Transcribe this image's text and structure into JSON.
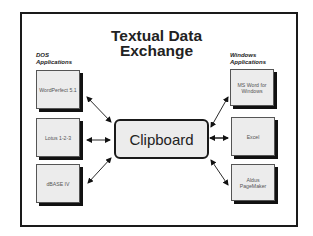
{
  "title": {
    "line1": "Textual Data",
    "line2": "Exchange"
  },
  "dos": {
    "label_line1": "DOS",
    "label_line2": "Applications",
    "items": [
      {
        "label": "WordPerfect 5.1"
      },
      {
        "label": "Lotus 1-2-3"
      },
      {
        "label": "dBASE IV"
      }
    ]
  },
  "windows": {
    "label_line1": "Windows",
    "label_line2": "Applications",
    "items": [
      {
        "label": "MS Word for Windows"
      },
      {
        "label": "Excel"
      },
      {
        "label": "Aldus PageMaker"
      }
    ]
  },
  "center": {
    "label": "Clipboard"
  },
  "arrows": "bidirectional"
}
